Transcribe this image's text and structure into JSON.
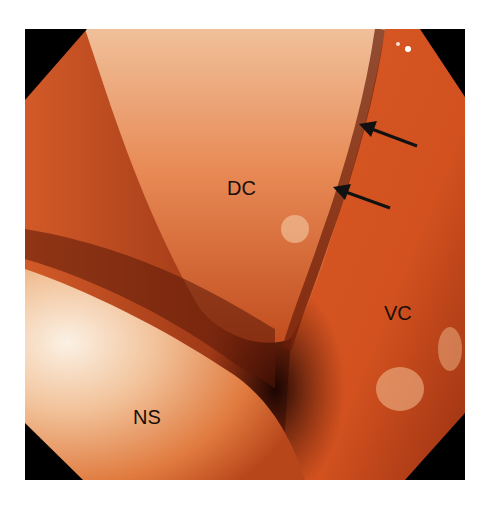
{
  "figure": {
    "type": "endoscopic photograph",
    "labels": [
      {
        "id": "dc",
        "text": "DC"
      },
      {
        "id": "vc",
        "text": "VC"
      },
      {
        "id": "ns",
        "text": "NS"
      }
    ],
    "arrows": [
      {
        "id": "arrow-1",
        "direction": "pointing up-left"
      },
      {
        "id": "arrow-2",
        "direction": "pointing up-left"
      }
    ],
    "colors": {
      "tissue": "#d2511f",
      "tissue_light": "#f1b98e",
      "shadow": "#3a0d05",
      "corner_mask": "#000000"
    }
  }
}
